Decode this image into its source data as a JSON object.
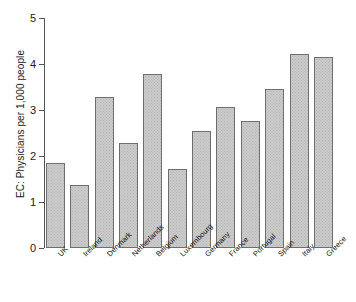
{
  "chart_data": {
    "type": "bar",
    "title": "",
    "subtitle": "",
    "xlabel": "",
    "ylabel": "EC: Physicians per 1,000 people",
    "categories": [
      "UK",
      "Ireland",
      "Denmark",
      "Netherlands",
      "Belgium",
      "Luxembourg",
      "Germany",
      "France",
      "Portugal",
      "Spain",
      "Italy",
      "Greece"
    ],
    "values": [
      1.85,
      1.37,
      3.28,
      2.28,
      3.78,
      1.72,
      2.54,
      3.07,
      2.76,
      3.46,
      4.22,
      4.15
    ],
    "series": [
      {
        "name": "Physicians per 1,000 people",
        "values": [
          1.85,
          1.37,
          3.28,
          2.28,
          3.78,
          1.72,
          2.54,
          3.07,
          2.76,
          3.46,
          4.22,
          4.15
        ]
      }
    ],
    "ylim": [
      0,
      5
    ],
    "yticks": [
      0,
      1,
      2,
      3,
      4,
      5
    ],
    "ytick_labels": [
      "0",
      "1",
      "2",
      "3",
      "4",
      "5"
    ],
    "grid": false,
    "legend": false,
    "legend_position": "none",
    "bar_fill_color": "#cbcbcb",
    "bar_edge_color": "#6f6f6f",
    "axis_color": "#555555",
    "background_color": "#ffffff"
  }
}
